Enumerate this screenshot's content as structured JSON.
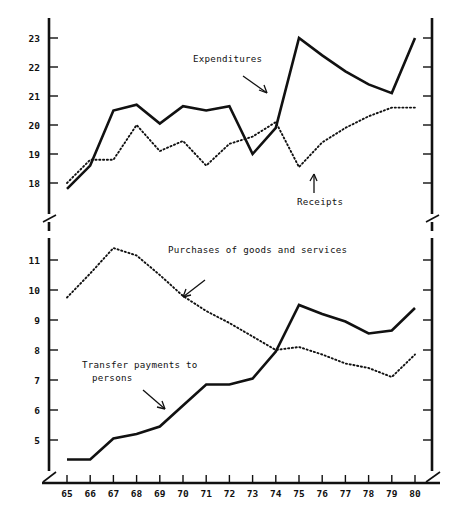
{
  "figure": {
    "background": "#ffffff",
    "ink_color": "#111111",
    "panels": 2
  },
  "chart_data": [
    {
      "type": "line",
      "panel": "upper",
      "title": "",
      "subtitle": "",
      "xlabel": "",
      "ylabel": "",
      "grid": false,
      "legend_position": "inline-annotations",
      "x": [
        65,
        66,
        67,
        68,
        69,
        70,
        71,
        72,
        73,
        74,
        75,
        76,
        77,
        78,
        79,
        80
      ],
      "xtick_labels": [
        "65",
        "66",
        "67",
        "68",
        "69",
        "70",
        "71",
        "72",
        "73",
        "74",
        "75",
        "76",
        "77",
        "78",
        "79",
        "80"
      ],
      "ylim": [
        17.2,
        23.4
      ],
      "ytick_values": [
        18,
        19,
        20,
        21,
        22,
        23
      ],
      "ytick_labels": [
        "18",
        "19",
        "20",
        "21",
        "22",
        "23"
      ],
      "y_axis_break": true,
      "series": [
        {
          "name": "Expenditures",
          "style": "solid",
          "values": [
            17.8,
            18.6,
            20.5,
            20.7,
            20.05,
            20.65,
            20.5,
            20.65,
            19.0,
            19.9,
            23.0,
            22.4,
            21.85,
            21.4,
            21.1,
            23.0
          ]
        },
        {
          "name": "Receipts",
          "style": "dotted",
          "values": [
            18.0,
            18.8,
            18.8,
            20.0,
            19.1,
            19.45,
            18.6,
            19.35,
            19.6,
            20.1,
            18.55,
            19.4,
            19.9,
            20.3,
            20.6,
            20.6
          ]
        }
      ],
      "annotations": [
        {
          "text": "Expenditures",
          "series": "Expenditures",
          "x_px": 193,
          "y_px": 62
        },
        {
          "text": "Receipts",
          "series": "Receipts",
          "x_px": 297,
          "y_px": 205
        }
      ]
    },
    {
      "type": "line",
      "panel": "lower",
      "title": "",
      "subtitle": "",
      "xlabel": "",
      "ylabel": "",
      "grid": false,
      "legend_position": "inline-annotations",
      "x": [
        65,
        66,
        67,
        68,
        69,
        70,
        71,
        72,
        73,
        74,
        75,
        76,
        77,
        78,
        79,
        80
      ],
      "xtick_labels": [
        "65",
        "66",
        "67",
        "68",
        "69",
        "70",
        "71",
        "72",
        "73",
        "74",
        "75",
        "76",
        "77",
        "78",
        "79",
        "80"
      ],
      "ylim": [
        4.0,
        11.8
      ],
      "ytick_values": [
        5,
        6,
        7,
        8,
        9,
        10,
        11
      ],
      "ytick_labels": [
        "5",
        "6",
        "7",
        "8",
        "9",
        "10",
        "11"
      ],
      "y_axis_break": true,
      "series": [
        {
          "name": "Purchases of goods and services",
          "style": "dotted",
          "values": [
            9.75,
            10.55,
            11.4,
            11.15,
            10.5,
            9.8,
            9.3,
            8.9,
            8.45,
            8.0,
            8.1,
            7.85,
            7.55,
            7.4,
            7.1,
            7.85
          ]
        },
        {
          "name": "Transfer payments to persons",
          "style": "solid",
          "values": [
            4.35,
            4.35,
            5.05,
            5.2,
            5.45,
            6.15,
            6.85,
            6.85,
            7.05,
            7.95,
            9.5,
            9.2,
            8.95,
            8.55,
            8.65,
            9.4
          ]
        }
      ],
      "annotations": [
        {
          "text": "Purchases of goods and services",
          "series": "Purchases of goods and services",
          "x_px": 168,
          "y_px": 253
        },
        {
          "text": "Transfer payments to",
          "series": "Transfer payments to persons",
          "x_px": 82,
          "y_px": 368
        },
        {
          "text": "persons",
          "series": "Transfer payments to persons",
          "x_px": 92,
          "y_px": 381
        }
      ]
    }
  ],
  "axes": {
    "upper": {
      "ytick_labels": [
        "23",
        "22",
        "21",
        "20",
        "19",
        "18"
      ],
      "break_symbol": "/"
    },
    "lower": {
      "ytick_labels": [
        "11",
        "10",
        "9",
        "8",
        "7",
        "6",
        "5"
      ],
      "break_symbol": "/"
    },
    "x": {
      "tick_labels": [
        "65",
        "66",
        "67",
        "68",
        "69",
        "70",
        "71",
        "72",
        "73",
        "74",
        "75",
        "76",
        "77",
        "78",
        "79",
        "80"
      ]
    }
  },
  "annotations": {
    "expenditures": "Expenditures",
    "receipts": "Receipts",
    "purchases": "Purchases of goods and services",
    "transfer_line1": "Transfer payments to",
    "transfer_line2": "persons"
  }
}
